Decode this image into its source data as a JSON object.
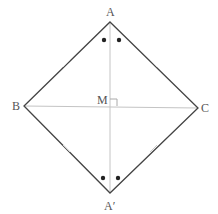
{
  "diagram": {
    "points": {
      "A": {
        "label": "A",
        "x": 110,
        "y": 22
      },
      "B": {
        "label": "B",
        "x": 24,
        "y": 106
      },
      "C": {
        "label": "C",
        "x": 198,
        "y": 108
      },
      "A_prime": {
        "label": "A′",
        "x": 110,
        "y": 193
      },
      "M": {
        "label": "M",
        "x": 111,
        "y": 106
      }
    },
    "colors": {
      "sides": "#444444",
      "diagonals": "#bbbbbb",
      "marks": "#222222",
      "ticks": "#cccccc"
    }
  }
}
